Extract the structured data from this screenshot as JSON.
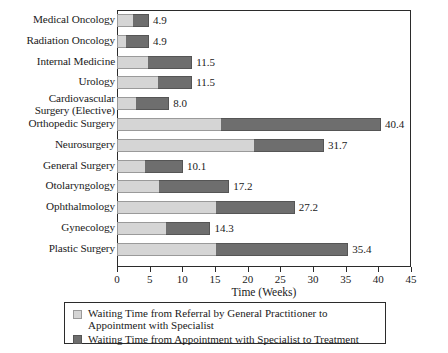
{
  "chart_data": {
    "type": "bar",
    "orientation": "horizontal",
    "stacked": true,
    "title": "",
    "xlabel": "Time (Weeks)",
    "ylabel": "",
    "xlim": [
      0,
      45
    ],
    "xticks": [
      0,
      5,
      10,
      15,
      20,
      25,
      30,
      35,
      40,
      45
    ],
    "xtick_labels": [
      "0",
      "5",
      "10",
      "15",
      "20",
      "25",
      "30",
      "35",
      "40",
      "45"
    ],
    "grid": false,
    "legend_position": "bottom",
    "categories": [
      "Medical Oncology",
      "Radiation Oncology",
      "Internal Medicine",
      "Urology",
      "Cardiovascular\nSurgery (Elective)",
      "Orthopedic Surgery",
      "Neurosurgery",
      "General Surgery",
      "Otolaryngology",
      "Ophthalmology",
      "Gynecology",
      "Plastic Surgery"
    ],
    "series": [
      {
        "name": "Waiting Time from Referral by General Practitioner to Appointment with Specialist",
        "color": "#d5d5d5",
        "values": [
          2.5,
          1.4,
          4.7,
          6.3,
          2.9,
          15.9,
          20.9,
          4.3,
          6.4,
          15.1,
          7.5,
          15.2
        ]
      },
      {
        "name": "Waiting Time from Appointment with Specialist to Treatment",
        "color": "#6e6e6e",
        "values": [
          2.4,
          3.5,
          6.8,
          5.2,
          5.1,
          24.5,
          10.8,
          5.8,
          10.8,
          12.1,
          6.8,
          20.2
        ]
      }
    ],
    "totals": [
      4.9,
      4.9,
      11.5,
      11.5,
      8.0,
      40.4,
      31.7,
      10.1,
      17.2,
      27.2,
      14.3,
      35.4
    ],
    "total_labels": [
      "4.9",
      "4.9",
      "11.5",
      "11.5",
      "8.0",
      "40.4",
      "31.7",
      "10.1",
      "17.2",
      "27.2",
      "14.3",
      "35.4"
    ]
  },
  "legend": {
    "items": [
      {
        "swatch": "s1",
        "label": "Waiting Time from Referral by General Practitioner to Appointment with Specialist"
      },
      {
        "swatch": "s2",
        "label": "Waiting Time from Appointment with Specialist to Treatment"
      }
    ]
  },
  "colors": {
    "series1": "#d5d5d5",
    "series2": "#6e6e6e",
    "axis": "#2b2b2b",
    "text": "#1a1a1a",
    "background": "#ffffff"
  }
}
